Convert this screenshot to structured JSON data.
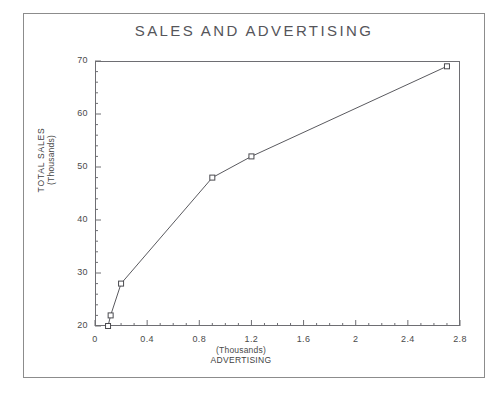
{
  "chart_data": {
    "type": "line",
    "title": "SALES AND ADVERTISING",
    "xlabel": "ADVERTISING",
    "xunits": "(Thousands)",
    "ylabel": "TOTAL SALES",
    "yunits": "(Thousands)",
    "xlim": [
      0,
      2.8
    ],
    "ylim": [
      20,
      70
    ],
    "grid": false,
    "legend": null,
    "marker": "open-square",
    "x_ticks": [
      "0",
      "0.4",
      "0.8",
      "1.2",
      "1.6",
      "2",
      "2.4",
      "2.8"
    ],
    "x_tick_values": [
      0,
      0.4,
      0.8,
      1.2,
      1.6,
      2,
      2.4,
      2.8
    ],
    "y_ticks": [
      "20",
      "30",
      "40",
      "50",
      "60",
      "70"
    ],
    "y_tick_values": [
      20,
      30,
      40,
      50,
      60,
      70
    ],
    "x": [
      0.1,
      0.12,
      0.2,
      0.9,
      1.2,
      2.7
    ],
    "values": [
      20,
      22,
      28,
      48,
      52,
      69
    ],
    "points": [
      {
        "x": 0.1,
        "y": 20
      },
      {
        "x": 0.12,
        "y": 22
      },
      {
        "x": 0.2,
        "y": 28
      },
      {
        "x": 0.9,
        "y": 48
      },
      {
        "x": 1.2,
        "y": 52
      },
      {
        "x": 2.7,
        "y": 69
      }
    ],
    "series": [
      {
        "name": "TOTAL SALES",
        "x": [
          0.1,
          0.12,
          0.2,
          0.9,
          1.2,
          2.7
        ],
        "values": [
          20,
          22,
          28,
          48,
          52,
          69
        ]
      }
    ]
  },
  "colors": {
    "line": "#5a5a5f",
    "marker_stroke": "#4a4a4f",
    "marker_fill": "#ffffff",
    "axis": "#6e6e73",
    "text": "#4a4a4a",
    "frame": "#8c8c8c",
    "background": "#ffffff"
  }
}
